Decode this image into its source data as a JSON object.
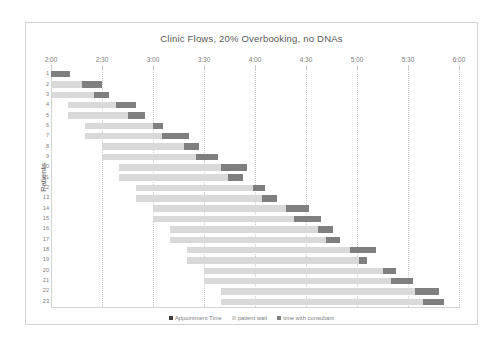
{
  "chart_data": {
    "type": "bar",
    "subtype": "stacked-horizontal-gantt",
    "title": "Clinic Flows, 20% Overbooking, no DNAs",
    "xlabel": "",
    "ylabel": "Patients",
    "xlim": [
      "2:00",
      "6:00"
    ],
    "x_tick_labels": [
      "2:00",
      "2:30",
      "3:00",
      "3:30",
      "4:00",
      "4:30",
      "5:00",
      "5:30",
      "6:00"
    ],
    "x_tick_minutes": [
      0,
      30,
      60,
      90,
      120,
      150,
      180,
      210,
      240
    ],
    "grid": true,
    "legend_position": "bottom",
    "categories": [
      "1",
      "2",
      "3",
      "4",
      "5",
      "6",
      "7",
      "8",
      "9",
      "10",
      "11",
      "12",
      "13",
      "14",
      "15",
      "16",
      "17",
      "18",
      "19",
      "20",
      "21",
      "22",
      "23"
    ],
    "series": [
      {
        "name": "Appointment Time",
        "color": "#3f3f3f",
        "note": "minutes after 2:00 at which the patient's appointment is scheduled",
        "values": [
          0,
          0,
          0,
          10,
          10,
          20,
          20,
          30,
          30,
          40,
          40,
          50,
          50,
          60,
          60,
          70,
          70,
          80,
          80,
          90,
          90,
          100,
          100
        ]
      },
      {
        "name": "patient wait",
        "color": "#d9d9d9",
        "note": "minutes of waiting before being seen",
        "values": [
          0,
          18,
          25,
          28,
          35,
          40,
          45,
          48,
          55,
          60,
          64,
          69,
          74,
          78,
          83,
          87,
          92,
          96,
          101,
          105,
          110,
          114,
          119
        ]
      },
      {
        "name": "time with consultant",
        "color": "#7f7f7f",
        "note": "minutes spent in consultation",
        "values": [
          11,
          12,
          9,
          12,
          10,
          6,
          16,
          9,
          13,
          15,
          9,
          7,
          9,
          14,
          16,
          9,
          8,
          15,
          5,
          8,
          13,
          14,
          12
        ]
      }
    ]
  },
  "legend": {
    "items": [
      {
        "label": "Appointment Time",
        "color": "#3f3f3f"
      },
      {
        "label": "patient wait",
        "color": "#d9d9d9"
      },
      {
        "label": "time with consultant",
        "color": "#7f7f7f"
      }
    ]
  }
}
